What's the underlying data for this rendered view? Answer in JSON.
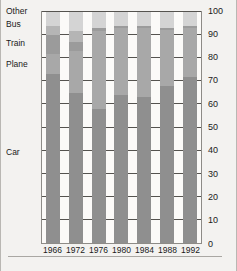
{
  "chart_data": {
    "type": "bar",
    "stacked": true,
    "title": "",
    "xlabel": "",
    "ylabel": "",
    "ylim": [
      0,
      100
    ],
    "ytick_step": 10,
    "grid": true,
    "legend_position": "left-outside",
    "categories": [
      "1966",
      "1972",
      "1976",
      "1980",
      "1984",
      "1988",
      "1992"
    ],
    "series": [
      {
        "name": "Car",
        "color": "#8f8f8f",
        "values": [
          73,
          65,
          58,
          64,
          63,
          68,
          72
        ]
      },
      {
        "name": "Plane",
        "color": "#a8a8a8",
        "values": [
          9,
          18,
          34,
          29,
          30,
          24,
          21
        ]
      },
      {
        "name": "Train",
        "color": "#9b9b9b",
        "values": [
          8,
          4,
          1,
          1,
          1,
          1,
          1
        ]
      },
      {
        "name": "Bus",
        "color": "#b5b5b5",
        "values": [
          4,
          5,
          0,
          0,
          0,
          0,
          0
        ]
      },
      {
        "name": "Other",
        "color": "#d4d4d4",
        "values": [
          6,
          8,
          7,
          6,
          6,
          7,
          6
        ]
      }
    ]
  },
  "legend": {
    "items": [
      {
        "label": "Other",
        "top": 6
      },
      {
        "label": "Bus",
        "top": 19
      },
      {
        "label": "Train",
        "top": 38
      },
      {
        "label": "Plane",
        "top": 59
      },
      {
        "label": "Car",
        "top": 147
      }
    ]
  },
  "y_axis": {
    "ticks": [
      "100",
      "90",
      "80",
      "70",
      "60",
      "50",
      "40",
      "30",
      "20",
      "10",
      "0"
    ]
  },
  "x_axis": {
    "ticks": [
      "1966",
      "1972",
      "1976",
      "1980",
      "1984",
      "1988",
      "1992"
    ]
  },
  "colors": {
    "background": "#f3f2f0",
    "plot_background": "#fbfaf8",
    "grid": "#55534f",
    "frame": "#8d8b87",
    "text": "#1a1a1a"
  }
}
